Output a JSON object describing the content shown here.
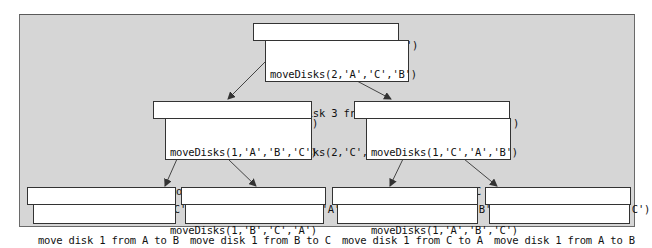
{
  "diagram": {
    "nodes": {
      "root": {
        "call": "moveDisks(3,'A','B','C')",
        "body": [
          "moveDisks(2,'A','C','B')",
          "move disk 3 from A to B",
          "moveDisks(2,'C','B','A')"
        ]
      },
      "left": {
        "call": "moveDisks(2,'A','C','B')",
        "body": [
          "moveDisks(1,'A','B','C')",
          "move disk 2 from A to C",
          "moveDisks(1,'B','C','A')"
        ]
      },
      "right": {
        "call": "moveDisks(2,'C','B','A')",
        "body": [
          "moveDisks(1,'C','A','B')",
          "move disk 2 from C to B",
          "moveDisks(1,'A','B','C')"
        ]
      },
      "leaf1": {
        "call": "moveDisks(1,'A','B','C')",
        "body": [
          "move disk 1 from A to B"
        ]
      },
      "leaf2": {
        "call": "moveDisks(1,'B','C','A')",
        "body": [
          "move disk 1 from B to C"
        ]
      },
      "leaf3": {
        "call": "moveDisks(1,'C','A','B')",
        "body": [
          "move disk 1 from C to A"
        ]
      },
      "leaf4": {
        "call": "moveDisks(1,'A','B','C')",
        "body": [
          "move disk 1 from A to B"
        ]
      }
    },
    "edges": [
      {
        "from": "root",
        "to": "left"
      },
      {
        "from": "root",
        "to": "right"
      },
      {
        "from": "left",
        "to": "leaf1"
      },
      {
        "from": "left",
        "to": "leaf2"
      },
      {
        "from": "right",
        "to": "leaf3"
      },
      {
        "from": "right",
        "to": "leaf4"
      }
    ],
    "colors": {
      "panel_background": "#d6d6d6",
      "panel_border": "#6a6a6a",
      "box_background": "#ffffff",
      "box_border": "#333333",
      "arrow": "#333333"
    }
  }
}
